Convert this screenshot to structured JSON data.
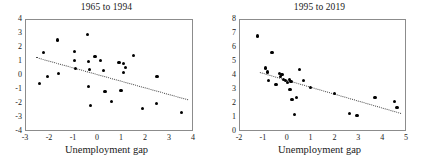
{
  "figure": {
    "width": 426,
    "height": 163,
    "background": "#ffffff",
    "point_color": "#000000",
    "frame_color": "#8c8c8c",
    "trend_color": "#4a4a4a"
  },
  "chart_data": [
    {
      "type": "scatter",
      "title": "1965 to 1994",
      "xlabel": "Unemployment gap",
      "ylabel": "",
      "xlim": [
        -3,
        4
      ],
      "ylim": [
        -4,
        4
      ],
      "xticks": [
        -3,
        -2,
        -1,
        0,
        1,
        2,
        3,
        4
      ],
      "xticklabels": [
        "-3",
        "-2",
        "-1",
        "0",
        "1",
        "2",
        "3",
        "4"
      ],
      "yticks": [
        -4,
        -3,
        -2,
        -1,
        0,
        1,
        2,
        3,
        4
      ],
      "yticklabels": [
        "-4",
        "-3",
        "-2",
        "-1",
        "0",
        "1",
        "2",
        "3",
        "4"
      ],
      "grid": false,
      "legend": "none",
      "points": [
        [
          -2.4,
          -0.6
        ],
        [
          -2.22,
          1.6
        ],
        [
          -2.05,
          -0.12
        ],
        [
          -1.63,
          2.5
        ],
        [
          -1.6,
          0.12
        ],
        [
          -0.95,
          1.68
        ],
        [
          -0.93,
          1.05
        ],
        [
          -0.88,
          0.46
        ],
        [
          -0.4,
          2.92
        ],
        [
          -0.36,
          0.97
        ],
        [
          -0.34,
          -0.82
        ],
        [
          -0.3,
          0.38
        ],
        [
          -0.28,
          -2.15
        ],
        [
          -0.08,
          1.32
        ],
        [
          0.14,
          1.02
        ],
        [
          0.28,
          0.35
        ],
        [
          0.33,
          -1.2
        ],
        [
          0.62,
          -1.92
        ],
        [
          0.92,
          0.88
        ],
        [
          1.0,
          -1.1
        ],
        [
          1.1,
          0.82
        ],
        [
          1.12,
          0.18
        ],
        [
          1.18,
          0.52
        ],
        [
          1.52,
          1.38
        ],
        [
          1.88,
          -2.38
        ],
        [
          2.48,
          -2.05
        ],
        [
          2.5,
          -0.12
        ],
        [
          3.52,
          -2.7
        ]
      ],
      "trendline": {
        "x1": -2.55,
        "y1": 1.28,
        "x2": 3.8,
        "y2": -1.75
      }
    },
    {
      "type": "scatter",
      "title": "1995 to 2019",
      "xlabel": "Unemployment gap",
      "ylabel": "",
      "xlim": [
        -2,
        5
      ],
      "ylim": [
        0,
        8
      ],
      "xticks": [
        -2,
        -1,
        0,
        1,
        2,
        3,
        4,
        5
      ],
      "xticklabels": [
        "-2",
        "-1",
        "0",
        "1",
        "2",
        "3",
        "4",
        "5"
      ],
      "yticks": [
        0,
        1,
        2,
        3,
        4,
        5,
        6,
        7,
        8
      ],
      "yticklabels": [
        "0",
        "1",
        "2",
        "3",
        "4",
        "5",
        "6",
        "7",
        "8"
      ],
      "grid": false,
      "legend": "none",
      "points": [
        [
          -1.22,
          6.78
        ],
        [
          -0.88,
          4.5
        ],
        [
          -0.82,
          4.22
        ],
        [
          -0.78,
          3.62
        ],
        [
          -0.62,
          5.58
        ],
        [
          -0.45,
          3.35
        ],
        [
          -0.3,
          4.08
        ],
        [
          -0.26,
          3.88
        ],
        [
          -0.2,
          4.02
        ],
        [
          -0.12,
          3.7
        ],
        [
          -0.05,
          3.58
        ],
        [
          0.04,
          3.48
        ],
        [
          0.1,
          3.7
        ],
        [
          0.14,
          2.98
        ],
        [
          0.18,
          3.52
        ],
        [
          0.22,
          2.24
        ],
        [
          0.34,
          1.18
        ],
        [
          0.42,
          2.4
        ],
        [
          0.52,
          4.42
        ],
        [
          0.7,
          3.62
        ],
        [
          1.0,
          3.08
        ],
        [
          2.0,
          2.68
        ],
        [
          2.62,
          1.24
        ],
        [
          2.95,
          1.12
        ],
        [
          3.7,
          2.42
        ],
        [
          4.52,
          2.1
        ],
        [
          4.62,
          1.7
        ]
      ],
      "trendline": {
        "x1": -1.1,
        "y1": 4.2,
        "x2": 4.8,
        "y2": 1.28
      }
    }
  ]
}
